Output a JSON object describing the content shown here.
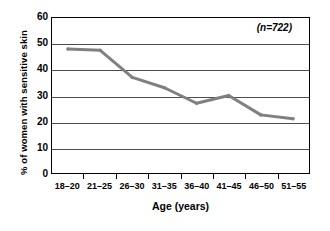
{
  "chart_data": {
    "type": "line",
    "title": "",
    "xlabel": "Age (years)",
    "ylabel": "% of women with sensitive skin",
    "categories": [
      "18–20",
      "21–25",
      "26–30",
      "31–35",
      "36–40",
      "41–45",
      "46–50",
      "51–55"
    ],
    "values": [
      48,
      47.5,
      37,
      33,
      27,
      30,
      22.5,
      21
    ],
    "series": [
      {
        "name": "% of women with sensitive skin",
        "values": [
          48,
          47.5,
          37,
          33,
          27,
          30,
          22.5,
          21
        ]
      }
    ],
    "ylim": [
      0,
      60
    ],
    "yticks": [
      0,
      10,
      20,
      30,
      40,
      50,
      60
    ],
    "ytick_labels": [
      "0",
      "10",
      "20",
      "30",
      "40",
      "50",
      "60"
    ],
    "grid": true,
    "legend": false,
    "annotation": "(n=722)",
    "line_color": "#808080",
    "frame_color": "#000000",
    "grid_color": "#4d4d4d"
  }
}
